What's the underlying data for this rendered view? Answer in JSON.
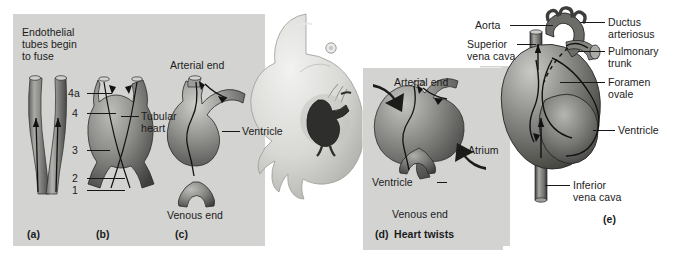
{
  "figure": {
    "background_color": "#ffffff",
    "panel_color": "#d3d3d1",
    "text_color": "#1b1b1b"
  },
  "panel_a": {
    "key": "(a)",
    "caption": "Endothelial\ntubes begin\nto fuse",
    "caption_line1": "Endothelial",
    "caption_line2": "tubes begin",
    "caption_line3": "to fuse"
  },
  "panel_b": {
    "key": "(b)",
    "numbers": [
      "4a",
      "4",
      "3",
      "2",
      "1"
    ],
    "label_line1": "Tubular",
    "label_line2": "heart"
  },
  "panel_c": {
    "key": "(c)",
    "top_label": "Arterial end",
    "bottom_label": "Venous end",
    "side_label": "Ventricle"
  },
  "panel_d": {
    "key": "(d)",
    "caption": "Heart twists",
    "top_label": "Arterial end",
    "bottom_label": "Venous end",
    "left_label": "Ventricle",
    "right_label": "Atrium"
  },
  "panel_e": {
    "key": "(e)",
    "labels_left": [
      {
        "id": "aorta",
        "text": "Aorta"
      },
      {
        "id": "superior-vena-cava",
        "line1": "Superior",
        "line2": "vena cava"
      }
    ],
    "labels_right": [
      {
        "id": "ductus-arteriosus",
        "line1": "Ductus",
        "line2": "arteriosus"
      },
      {
        "id": "pulmonary-trunk",
        "line1": "Pulmonary",
        "line2": "trunk"
      },
      {
        "id": "foramen-ovale",
        "line1": "Foramen",
        "line2": "ovale"
      },
      {
        "id": "ventricle",
        "line1": "Ventricle",
        "line2": ""
      }
    ],
    "labels_bottom": [
      {
        "id": "inferior-vena-cava",
        "line1": "Inferior",
        "line2": "vena cava"
      }
    ]
  }
}
